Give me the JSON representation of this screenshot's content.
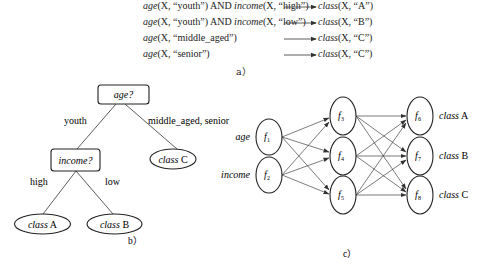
{
  "panel_a": {
    "caption": "a）",
    "rules": [
      {
        "lhs_parts": [
          [
            "age",
            true
          ],
          [
            "(X, “youth”) AND ",
            false
          ],
          [
            "income",
            true
          ],
          [
            "(X, “high”)",
            false
          ]
        ],
        "rhs_fn": "class",
        "rhs_args": "(X, “A”)"
      },
      {
        "lhs_parts": [
          [
            "age",
            true
          ],
          [
            "(X, “youth”) AND ",
            false
          ],
          [
            "income",
            true
          ],
          [
            "(X, “low”)",
            false
          ]
        ],
        "rhs_fn": "class",
        "rhs_args": "(X, “B”)"
      },
      {
        "lhs_parts": [
          [
            "age",
            true
          ],
          [
            "(X, “middle_aged”)",
            false
          ]
        ],
        "rhs_fn": "class",
        "rhs_args": "(X, “C”)"
      },
      {
        "lhs_parts": [
          [
            "age",
            true
          ],
          [
            "(X, “senior”)",
            false
          ]
        ],
        "rhs_fn": "class",
        "rhs_args": "(X, “C”)"
      }
    ]
  },
  "panel_b": {
    "caption": "b）",
    "root": {
      "label": "age?"
    },
    "edge_left_label": "youth",
    "edge_right_label": "middle_aged, senior",
    "income_node": {
      "label": "income?"
    },
    "leaf_c": {
      "italic": "class",
      "normal": " C"
    },
    "edge_high_label": "high",
    "edge_low_label": "low",
    "leaf_a": {
      "italic": "class",
      "normal": " A"
    },
    "leaf_b": {
      "italic": "class",
      "normal": " B"
    }
  },
  "panel_c": {
    "caption": "c）",
    "input_labels": [
      "age",
      "income"
    ],
    "input_nodes": [
      {
        "f": "f",
        "sub": "1"
      },
      {
        "f": "f",
        "sub": "2"
      }
    ],
    "hidden_nodes": [
      {
        "f": "f",
        "sub": "3"
      },
      {
        "f": "f",
        "sub": "4"
      },
      {
        "f": "f",
        "sub": "5"
      }
    ],
    "output_nodes": [
      {
        "f": "f",
        "sub": "6"
      },
      {
        "f": "f",
        "sub": "7"
      },
      {
        "f": "f",
        "sub": "8"
      }
    ],
    "output_labels": [
      {
        "italic": "class",
        "normal": " A"
      },
      {
        "italic": "class",
        "normal": " B"
      },
      {
        "italic": "class",
        "normal": " C"
      }
    ]
  }
}
